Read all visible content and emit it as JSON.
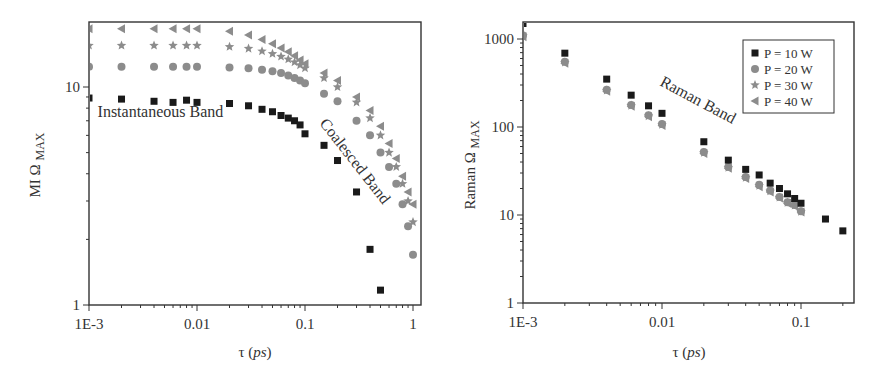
{
  "chart_data": [
    {
      "type": "scatter",
      "title": "",
      "xlabel": "τ (ps)",
      "ylabel": "MI Ω MAX",
      "xscale": "log",
      "yscale": "log",
      "xlim": [
        0.001,
        1.2
      ],
      "ylim": [
        1,
        20
      ],
      "xticks": [
        {
          "v": 0.001,
          "label": "1E-3"
        },
        {
          "v": 0.01,
          "label": "0.01"
        },
        {
          "v": 0.1,
          "label": "0.1"
        },
        {
          "v": 1,
          "label": "1"
        }
      ],
      "yticks": [
        {
          "v": 1,
          "label": "1"
        },
        {
          "v": 10,
          "label": "10"
        }
      ],
      "grid": false,
      "annotations": [
        {
          "text": "Instantaneous Band",
          "x": 0.0012,
          "y": 7.3,
          "rotate": 0
        },
        {
          "text": "Coalesced Band",
          "x": 0.135,
          "y": 6.8,
          "rotate": 52
        }
      ],
      "series": [
        {
          "name": "P = 10 W",
          "marker": "square",
          "color": "#1a1a1a",
          "x": [
            0.001,
            0.002,
            0.004,
            0.006,
            0.008,
            0.01,
            0.02,
            0.03,
            0.04,
            0.05,
            0.06,
            0.07,
            0.08,
            0.09,
            0.1,
            0.15,
            0.2,
            0.3,
            0.4,
            0.5
          ],
          "y": [
            8.9,
            8.8,
            8.6,
            8.5,
            8.7,
            8.5,
            8.4,
            8.2,
            7.9,
            7.7,
            7.4,
            7.2,
            7.0,
            6.7,
            6.1,
            5.4,
            4.6,
            3.3,
            1.8,
            1.17
          ]
        },
        {
          "name": "P = 20 W",
          "marker": "circle",
          "color": "#8c8c8c",
          "x": [
            0.001,
            0.002,
            0.004,
            0.006,
            0.008,
            0.01,
            0.02,
            0.03,
            0.04,
            0.05,
            0.06,
            0.07,
            0.08,
            0.09,
            0.1,
            0.15,
            0.2,
            0.3,
            0.4,
            0.5,
            0.6,
            0.7,
            0.8,
            0.9,
            1.0
          ],
          "y": [
            12.4,
            12.4,
            12.4,
            12.4,
            12.4,
            12.4,
            12.3,
            12.2,
            12.0,
            11.8,
            11.6,
            11.3,
            11.0,
            10.7,
            10.4,
            9.3,
            8.6,
            7.0,
            6.0,
            5.0,
            4.3,
            3.6,
            2.9,
            2.3,
            1.7
          ]
        },
        {
          "name": "P = 30 W",
          "marker": "star",
          "color": "#8c8c8c",
          "x": [
            0.001,
            0.002,
            0.004,
            0.006,
            0.008,
            0.01,
            0.02,
            0.03,
            0.04,
            0.05,
            0.06,
            0.07,
            0.08,
            0.09,
            0.1,
            0.15,
            0.2,
            0.3,
            0.4,
            0.5,
            0.6,
            0.7,
            0.8,
            0.9,
            1.0
          ],
          "y": [
            15.5,
            15.5,
            15.5,
            15.5,
            15.5,
            15.5,
            15.3,
            15.0,
            14.6,
            14.2,
            13.8,
            13.4,
            13.0,
            12.6,
            12.2,
            11.0,
            10.0,
            8.5,
            7.2,
            6.0,
            5.0,
            4.3,
            3.6,
            3.0,
            2.4
          ]
        },
        {
          "name": "P = 40 W",
          "marker": "triangle-left",
          "color": "#8c8c8c",
          "x": [
            0.001,
            0.002,
            0.004,
            0.006,
            0.008,
            0.01,
            0.02,
            0.03,
            0.04,
            0.05,
            0.06,
            0.07,
            0.08,
            0.09,
            0.1,
            0.15,
            0.2,
            0.3,
            0.4,
            0.5,
            0.6,
            0.7,
            0.8,
            0.9,
            1.0
          ],
          "y": [
            18.5,
            18.5,
            18.5,
            18.5,
            18.5,
            18.5,
            18.0,
            17.3,
            16.5,
            15.8,
            15.1,
            14.5,
            13.9,
            13.3,
            12.8,
            11.6,
            10.7,
            9.0,
            7.8,
            6.6,
            5.5,
            4.7,
            3.9,
            3.3,
            2.9
          ]
        }
      ]
    },
    {
      "type": "scatter",
      "title": "",
      "xlabel": "τ (ps)",
      "ylabel": "Raman Ω MAX",
      "xscale": "log",
      "yscale": "log",
      "xlim": [
        0.001,
        0.3
      ],
      "ylim": [
        1,
        1500
      ],
      "xticks": [
        {
          "v": 0.001,
          "label": "1E-3"
        },
        {
          "v": 0.01,
          "label": "0.01"
        },
        {
          "v": 0.1,
          "label": "0.1"
        }
      ],
      "yticks": [
        {
          "v": 1,
          "label": "1"
        },
        {
          "v": 10,
          "label": "10"
        },
        {
          "v": 100,
          "label": "100"
        },
        {
          "v": 1000,
          "label": "1000"
        }
      ],
      "grid": false,
      "legend": {
        "position": "upper-right",
        "entries": [
          "P = 10 W",
          "P = 20 W",
          "P = 30 W",
          "P = 40 W"
        ]
      },
      "annotations": [
        {
          "text": "Raman Band",
          "x": 0.0095,
          "y": 300,
          "rotate": 28
        }
      ],
      "series": [
        {
          "name": "P = 10 W",
          "marker": "square",
          "color": "#1a1a1a",
          "x": [
            0.001,
            0.002,
            0.004,
            0.006,
            0.008,
            0.01,
            0.02,
            0.03,
            0.04,
            0.05,
            0.06,
            0.07,
            0.08,
            0.09,
            0.1,
            0.15,
            0.2
          ],
          "y": [
            1500,
            690,
            350,
            230,
            174,
            143,
            68,
            42,
            33,
            28.5,
            23,
            20,
            17.4,
            15.4,
            13.6,
            9.0,
            6.6
          ]
        },
        {
          "name": "P = 20 W",
          "marker": "circle",
          "color": "#8c8c8c",
          "x": [
            0.001,
            0.002,
            0.004,
            0.006,
            0.008,
            0.01,
            0.02,
            0.03,
            0.04,
            0.05,
            0.06,
            0.07,
            0.08,
            0.09,
            0.1
          ],
          "y": [
            1100,
            550,
            265,
            178,
            136,
            108,
            52,
            35,
            27,
            22,
            19,
            16,
            14,
            13,
            11
          ]
        },
        {
          "name": "P = 30 W",
          "marker": "star",
          "color": "#8c8c8c",
          "x": [
            0.001,
            0.002,
            0.004,
            0.006,
            0.008,
            0.01,
            0.02,
            0.03,
            0.04,
            0.05,
            0.06,
            0.07,
            0.08,
            0.09,
            0.1
          ],
          "y": [
            1080,
            540,
            260,
            175,
            133,
            106,
            51,
            34.5,
            26.5,
            21.5,
            18.6,
            15.8,
            13.8,
            12.8,
            10.9
          ]
        },
        {
          "name": "P = 40 W",
          "marker": "triangle-left",
          "color": "#8c8c8c",
          "x": [
            0.001,
            0.002,
            0.004,
            0.006,
            0.008,
            0.01,
            0.02,
            0.03,
            0.04,
            0.05,
            0.06,
            0.07,
            0.08,
            0.09,
            0.1
          ],
          "y": [
            1060,
            530,
            255,
            172,
            131,
            104,
            50,
            34,
            26,
            21,
            18.3,
            15.6,
            13.6,
            12.6,
            10.8
          ]
        }
      ]
    }
  ],
  "labels": {
    "left_ylabel_main": "MI Ω",
    "left_ylabel_sub": "MAX",
    "right_ylabel_main": "Raman Ω",
    "right_ylabel_sub": "MAX",
    "xlabel_tau": "τ (",
    "xlabel_unit": "ps",
    "xlabel_close": ")"
  }
}
